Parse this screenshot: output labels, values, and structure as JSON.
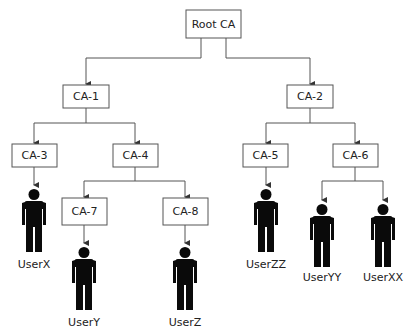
{
  "diagram": {
    "nodes": [
      {
        "id": "root",
        "label": "Root CA",
        "type": "ca"
      },
      {
        "id": "ca1",
        "label": "CA-1",
        "type": "ca",
        "parent": "root"
      },
      {
        "id": "ca2",
        "label": "CA-2",
        "type": "ca",
        "parent": "root"
      },
      {
        "id": "ca3",
        "label": "CA-3",
        "type": "ca",
        "parent": "ca1"
      },
      {
        "id": "ca4",
        "label": "CA-4",
        "type": "ca",
        "parent": "ca1"
      },
      {
        "id": "ca5",
        "label": "CA-5",
        "type": "ca",
        "parent": "ca2"
      },
      {
        "id": "ca6",
        "label": "CA-6",
        "type": "ca",
        "parent": "ca2"
      },
      {
        "id": "ca7",
        "label": "CA-7",
        "type": "ca",
        "parent": "ca4"
      },
      {
        "id": "ca8",
        "label": "CA-8",
        "type": "ca",
        "parent": "ca4"
      },
      {
        "id": "userx",
        "label": "UserX",
        "type": "user",
        "parent": "ca3"
      },
      {
        "id": "usery",
        "label": "UserY",
        "type": "user",
        "parent": "ca7"
      },
      {
        "id": "userz",
        "label": "UserZ",
        "type": "user",
        "parent": "ca8"
      },
      {
        "id": "userzz",
        "label": "UserZZ",
        "type": "user",
        "parent": "ca5"
      },
      {
        "id": "useryy",
        "label": "UserYY",
        "type": "user",
        "parent": "ca6"
      },
      {
        "id": "userxx",
        "label": "UserXX",
        "type": "user",
        "parent": "ca6"
      }
    ]
  }
}
